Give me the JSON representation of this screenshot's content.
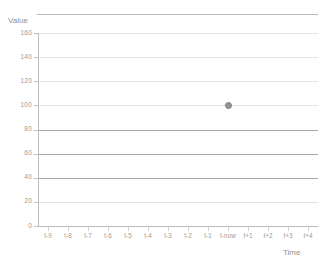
{
  "chart_data": {
    "type": "scatter",
    "title": "",
    "xlabel": "Time",
    "ylabel": "Value",
    "categories": [
      "t-9",
      "t-8",
      "t-7",
      "t-6",
      "t-5",
      "t-4",
      "t-3",
      "t-2",
      "t-1",
      "t-now",
      "t+1",
      "t+2",
      "t+3",
      "t+4"
    ],
    "yticks": [
      0,
      20,
      40,
      60,
      80,
      100,
      120,
      140,
      160
    ],
    "ylim": [
      0,
      160
    ],
    "grid": true,
    "legend": null,
    "series": [
      {
        "name": "Value",
        "marker": "circle",
        "color": "#949494",
        "points": [
          {
            "x": "t-now",
            "y": 100
          }
        ]
      }
    ]
  },
  "axes": {
    "y_title": "Value",
    "x_title": "Time"
  },
  "colors": {
    "gridline": "#e2e2e2",
    "gridline_strong": "#a8a8a8",
    "axis": "#bdbdbd",
    "tick_text": "#9a9a9a",
    "marker": "#949494"
  }
}
